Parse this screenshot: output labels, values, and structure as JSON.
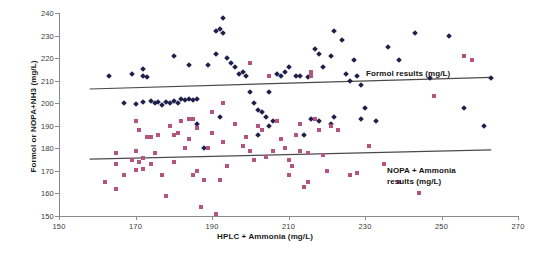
{
  "chart_data": {
    "type": "scatter",
    "title": "",
    "xlabel": "HPLC + Ammonia (mg/L)",
    "ylabel": "Formol or NOPA+NH3 (mg/L)",
    "xlim": [
      150,
      270
    ],
    "ylim": [
      150,
      240
    ],
    "xticks": [
      150,
      170,
      190,
      210,
      230,
      250,
      270
    ],
    "yticks": [
      150,
      160,
      170,
      180,
      190,
      200,
      210,
      220,
      230,
      240
    ],
    "grid": false,
    "legend_position": "inline-annotations",
    "annotations": [
      {
        "name": "formol-annotation",
        "text": "Formol results (mg/L)",
        "x": 228,
        "y": 203
      },
      {
        "name": "nopa-annotation",
        "text": "NOPA + Ammonia\nresults (mg/L)",
        "x": 233,
        "y": 179
      }
    ],
    "series": [
      {
        "name": "Formol results (mg/L)",
        "marker": "diamond",
        "color": "#1f1f4d",
        "trendline": {
          "x": [
            158,
            263
          ],
          "y": [
            206.3,
            211.5
          ],
          "color": "#4a4a4a"
        },
        "points": [
          [
            163,
            212
          ],
          [
            169,
            213
          ],
          [
            172,
            215
          ],
          [
            172,
            212
          ],
          [
            173,
            211.5
          ],
          [
            167,
            200
          ],
          [
            170,
            199.5
          ],
          [
            172,
            200.5
          ],
          [
            174,
            201
          ],
          [
            175,
            200
          ],
          [
            176,
            200.5
          ],
          [
            177,
            199
          ],
          [
            178,
            200.5
          ],
          [
            179,
            200
          ],
          [
            180,
            201
          ],
          [
            181,
            200
          ],
          [
            182,
            202
          ],
          [
            183,
            201.5
          ],
          [
            184,
            202
          ],
          [
            185,
            201.5
          ],
          [
            186,
            202
          ],
          [
            180,
            221
          ],
          [
            184,
            217
          ],
          [
            189,
            217
          ],
          [
            191,
            232
          ],
          [
            191,
            222
          ],
          [
            192,
            233
          ],
          [
            193,
            231
          ],
          [
            193,
            238
          ],
          [
            194,
            220
          ],
          [
            195,
            218
          ],
          [
            196,
            216
          ],
          [
            197,
            213
          ],
          [
            198,
            214
          ],
          [
            199,
            212
          ],
          [
            200,
            205
          ],
          [
            201,
            200
          ],
          [
            202,
            197
          ],
          [
            203,
            196
          ],
          [
            204,
            194
          ],
          [
            205,
            190
          ],
          [
            205,
            205
          ],
          [
            206,
            192
          ],
          [
            207,
            213
          ],
          [
            208,
            212
          ],
          [
            209,
            214
          ],
          [
            210,
            216
          ],
          [
            212,
            212
          ],
          [
            213,
            212
          ],
          [
            215,
            211.5
          ],
          [
            217,
            224
          ],
          [
            218,
            222
          ],
          [
            219,
            216
          ],
          [
            221,
            221
          ],
          [
            222,
            232
          ],
          [
            224,
            228
          ],
          [
            225,
            213
          ],
          [
            226,
            210
          ],
          [
            227,
            219
          ],
          [
            228,
            212
          ],
          [
            229,
            208
          ],
          [
            230,
            198
          ],
          [
            233,
            192
          ],
          [
            236,
            225
          ],
          [
            239,
            219
          ],
          [
            243,
            231
          ],
          [
            247,
            211
          ],
          [
            252,
            230
          ],
          [
            256,
            198
          ],
          [
            261,
            190
          ],
          [
            263,
            211
          ],
          [
            188,
            180
          ],
          [
            202,
            186
          ],
          [
            214,
            186
          ],
          [
            186,
            191
          ],
          [
            192,
            194
          ],
          [
            216,
            193
          ],
          [
            218,
            192
          ],
          [
            221,
            191
          ],
          [
            222,
            194
          ],
          [
            229,
            193
          ]
        ]
      },
      {
        "name": "NOPA + Ammonia results (mg/L)",
        "marker": "square",
        "color": "#b5557e",
        "trendline": {
          "x": [
            158,
            263
          ],
          "y": [
            175.2,
            179.3
          ],
          "color": "#4a4a4a"
        },
        "points": [
          [
            162,
            165
          ],
          [
            165,
            162
          ],
          [
            165,
            178
          ],
          [
            165,
            173
          ],
          [
            167,
            168
          ],
          [
            169,
            175
          ],
          [
            170,
            192
          ],
          [
            170,
            179
          ],
          [
            170,
            170.5
          ],
          [
            171,
            188
          ],
          [
            171,
            174
          ],
          [
            172,
            171
          ],
          [
            172,
            175.5
          ],
          [
            173,
            185
          ],
          [
            174,
            185
          ],
          [
            174,
            173
          ],
          [
            175,
            178
          ],
          [
            176,
            186
          ],
          [
            177,
            168
          ],
          [
            178,
            159
          ],
          [
            179,
            190
          ],
          [
            180,
            174
          ],
          [
            180,
            186
          ],
          [
            181,
            187
          ],
          [
            182,
            192
          ],
          [
            183,
            180
          ],
          [
            184,
            184
          ],
          [
            184,
            193
          ],
          [
            185,
            193
          ],
          [
            185,
            168
          ],
          [
            186,
            170
          ],
          [
            186,
            189
          ],
          [
            187,
            154
          ],
          [
            188,
            166
          ],
          [
            189,
            180
          ],
          [
            190,
            187
          ],
          [
            191,
            151
          ],
          [
            192,
            166
          ],
          [
            193,
            183
          ],
          [
            194,
            172
          ],
          [
            196,
            191
          ],
          [
            198,
            181
          ],
          [
            199,
            185
          ],
          [
            200,
            179
          ],
          [
            201,
            175
          ],
          [
            202,
            190
          ],
          [
            203,
            188
          ],
          [
            204,
            176
          ],
          [
            206,
            179
          ],
          [
            207,
            192
          ],
          [
            208,
            184
          ],
          [
            209,
            180
          ],
          [
            210,
            175
          ],
          [
            210,
            168
          ],
          [
            211,
            172
          ],
          [
            212,
            186
          ],
          [
            213,
            191
          ],
          [
            213,
            179
          ],
          [
            214,
            163
          ],
          [
            215,
            178
          ],
          [
            215,
            165
          ],
          [
            216,
            214
          ],
          [
            216,
            212
          ],
          [
            217,
            193
          ],
          [
            218,
            188
          ],
          [
            219,
            177
          ],
          [
            220,
            170
          ],
          [
            221,
            190
          ],
          [
            223,
            188
          ],
          [
            226,
            168
          ],
          [
            228,
            169
          ],
          [
            231,
            181
          ],
          [
            235,
            173
          ],
          [
            239,
            165
          ],
          [
            244,
            160
          ],
          [
            258,
            219
          ],
          [
            256,
            221
          ],
          [
            248,
            203
          ],
          [
            200,
            218
          ],
          [
            205,
            212
          ],
          [
            190,
            196
          ],
          [
            193,
            200
          ]
        ]
      }
    ]
  }
}
